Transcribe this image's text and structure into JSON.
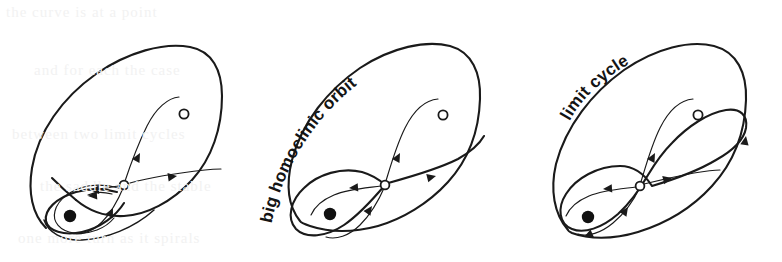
{
  "figure": {
    "kind": "phase-portrait-sequence",
    "background_color": "#ffffff",
    "ink_color": "#1a1a1a",
    "panels": [
      {
        "id": "panel-1",
        "index": 1,
        "caption": "",
        "fixed_points": [
          {
            "name": "stable-spiral",
            "marker": "filled-circle",
            "x": 70,
            "y": 216
          },
          {
            "name": "saddle",
            "marker": "open-circle",
            "x": 124,
            "y": 185
          },
          {
            "name": "unstable-focus",
            "marker": "open-circle",
            "x": 184,
            "y": 114
          }
        ],
        "features": [
          "big closed curve (outer boundary)",
          "saddle with four separatrix branches",
          "small inner spiral toward stable fixed point",
          "flow arrows on separatrices"
        ],
        "arrow_count": 5
      },
      {
        "id": "panel-2",
        "index": 2,
        "caption": "big homoclinic orbit",
        "caption_curved": true,
        "fixed_points": [
          {
            "name": "stable-spiral",
            "marker": "filled-circle",
            "x": 330,
            "y": 214
          },
          {
            "name": "saddle",
            "marker": "open-circle",
            "x": 385,
            "y": 185
          },
          {
            "name": "unstable-focus",
            "marker": "open-circle",
            "x": 443,
            "y": 115
          }
        ],
        "features": [
          "big closed curve (outer boundary)",
          "homoclinic loop through the saddle",
          "flow arrows on separatrices"
        ],
        "arrow_count": 4
      },
      {
        "id": "panel-3",
        "index": 3,
        "caption": "limit cycle",
        "caption_curved": true,
        "fixed_points": [
          {
            "name": "stable-spiral",
            "marker": "filled-circle",
            "x": 588,
            "y": 217
          },
          {
            "name": "saddle",
            "marker": "open-circle",
            "x": 640,
            "y": 186
          },
          {
            "name": "unstable-focus",
            "marker": "open-circle",
            "x": 698,
            "y": 115
          }
        ],
        "features": [
          "big closed curve (outer boundary)",
          "large limit cycle detouring around the saddle",
          "flow arrows on limit cycle and separatrices"
        ],
        "arrow_count": 6
      }
    ]
  },
  "ghost_text": {
    "note": "very faint show-through of text from the opposite page of the scanned book",
    "lines": [
      "the curve   is   at   a   point",
      "and   for   each   the   case",
      "between   two   limit   cycles",
      "the   saddle   and   the   stable",
      "one   more   turn   as   it   spirals"
    ]
  }
}
